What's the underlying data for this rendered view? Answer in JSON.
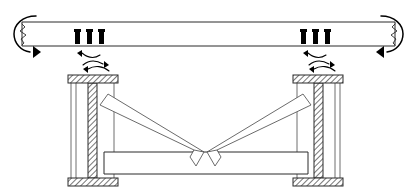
{
  "diagram": {
    "type": "structural-elevation",
    "colors": {
      "line": "#1a1a1a",
      "member_outline": "#2b2b2b",
      "brace_outline": "#5a5a5a",
      "hatch": "#555555",
      "bolt": "#000000",
      "arrow": "#000000",
      "background": "#ffffff"
    },
    "top_beam": {
      "name": "top-beam",
      "x": 22,
      "y": 22,
      "width": 373,
      "height": 24,
      "break_symbol_left": true,
      "break_symbol_right": true
    },
    "end_moments": [
      {
        "name": "moment-arrow-left",
        "side": "left",
        "direction": "counterclockwise",
        "cx": 26,
        "cy": 34
      },
      {
        "name": "moment-arrow-right",
        "side": "right",
        "direction": "clockwise",
        "cx": 391,
        "cy": 34
      }
    ],
    "bolt_groups": [
      {
        "name": "bolt-group-left",
        "count": 3,
        "start_x": 76,
        "spacing": 12,
        "top_y": 29,
        "height": 15,
        "width": 4
      },
      {
        "name": "bolt-group-right",
        "count": 3,
        "start_x": 302,
        "spacing": 12,
        "top_y": 29,
        "height": 15,
        "width": 4
      }
    ],
    "rotation_indicators": [
      {
        "name": "rotation-arrows-left",
        "cx": 95,
        "cy": 58
      },
      {
        "name": "rotation-arrows-right",
        "cx": 321,
        "cy": 58
      }
    ],
    "column_rotation_arrows": [
      {
        "name": "column-rotation-arrow-left",
        "cx": 97,
        "cy": 71
      },
      {
        "name": "column-rotation-arrow-right",
        "cx": 323,
        "cy": 71
      }
    ],
    "columns": [
      {
        "name": "column-left",
        "web_x": 88,
        "web_width": 9,
        "web_top": 82,
        "web_bottom": 179,
        "flange_outer_x": 71,
        "flange_inner_x": 114,
        "cap_plate": {
          "x": 68,
          "y": 75,
          "width": 50,
          "height": 8
        },
        "base_plate": {
          "x": 68,
          "y": 178,
          "width": 50,
          "height": 8
        }
      },
      {
        "name": "column-right",
        "web_x": 314,
        "web_width": 9,
        "web_top": 82,
        "web_bottom": 179,
        "flange_outer_x": 340,
        "flange_inner_x": 297,
        "cap_plate": {
          "x": 293,
          "y": 75,
          "width": 50,
          "height": 8
        },
        "base_plate": {
          "x": 293,
          "y": 178,
          "width": 50,
          "height": 8
        }
      }
    ],
    "braces": [
      {
        "name": "brace-left",
        "description": "diagonal brace from upper-left column to center apex"
      },
      {
        "name": "brace-right",
        "description": "diagonal brace from upper-right column to center apex"
      }
    ],
    "bottom_beam": {
      "name": "bottom-beam",
      "x": 104,
      "y": 152,
      "width": 204,
      "height": 22
    },
    "apex": {
      "name": "brace-apex-notch",
      "x": 206,
      "y": 152
    }
  }
}
